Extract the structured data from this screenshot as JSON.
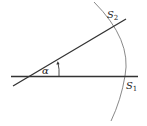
{
  "diagram": {
    "labels": {
      "angle": "α",
      "s1": "S",
      "s1_sub": "1",
      "s2": "S",
      "s2_sub": "2"
    },
    "colors": {
      "line": "#333333",
      "arc": "#777777",
      "text": "#222222"
    },
    "elements": [
      {
        "type": "line",
        "name": "horizontal-line",
        "from": [
          11,
          76
        ],
        "to": [
          138,
          76
        ]
      },
      {
        "type": "line",
        "name": "slanted-line",
        "from": [
          13,
          86
        ],
        "to": [
          126,
          19
        ]
      },
      {
        "type": "arc",
        "name": "circular-arc",
        "center": [
          30,
          76
        ],
        "radius": 95
      },
      {
        "type": "angle-arrow",
        "name": "angle-alpha-arrow",
        "from": [
          58,
          76
        ],
        "to": [
          58,
          62
        ]
      }
    ]
  }
}
